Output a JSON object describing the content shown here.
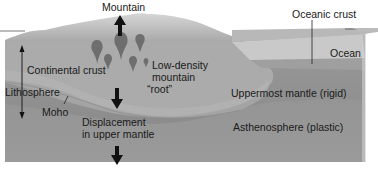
{
  "colors": {
    "background": "#ffffff",
    "surface_top": "#b9b9b9",
    "continental_crust": "#a9a9a9",
    "mountain_root": "#b4b4b4",
    "uppermost_mantle": "#959595",
    "asthenosphere": "#8a8a8a",
    "ocean": "#c6c6c6",
    "oceanic_crust": "#9e9e9e",
    "arrow": "#111111",
    "text": "#1a1a1a"
  },
  "labels": {
    "mountain": "Mountain",
    "oceanic_crust": "Oceanic crust",
    "ocean": "Ocean",
    "continental_crust": "Continental crust",
    "root_line1": "Low-density",
    "root_line2": "mountain",
    "root_line3": "“root”",
    "lithosphere": "Lithosphere",
    "moho": "Moho",
    "uppermost_mantle": "Uppermost mantle (rigid)",
    "displacement_line1": "Displacement",
    "displacement_line2": "in upper mantle",
    "asthenosphere": "Asthenosphere (plastic)"
  },
  "arrows": [
    {
      "name": "uplift",
      "direction": "up"
    },
    {
      "name": "root-sinking",
      "direction": "down"
    },
    {
      "name": "mantle-displacement",
      "direction": "down"
    },
    {
      "name": "lithosphere-extent",
      "direction": "both"
    }
  ]
}
